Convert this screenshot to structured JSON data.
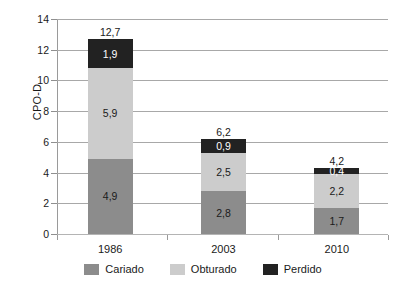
{
  "chart_data": {
    "type": "bar",
    "stacked": true,
    "title": "",
    "xlabel": "",
    "ylabel": "CPO-D",
    "categories": [
      "1986",
      "2003",
      "2010"
    ],
    "ylim": [
      0,
      14
    ],
    "yticks": [
      "0",
      "2",
      "4",
      "6",
      "8",
      "10",
      "12",
      "14"
    ],
    "ytick_values": [
      0,
      2,
      4,
      6,
      8,
      10,
      12,
      14
    ],
    "grid": "horizontal",
    "legend_position": "bottom",
    "decimal_separator": ",",
    "series": [
      {
        "name": "Cariado",
        "color": "#8c8c8c",
        "values": [
          4.9,
          2.8,
          1.7
        ],
        "labels": [
          "4,9",
          "2,8",
          "1,7"
        ],
        "label_color": "dark"
      },
      {
        "name": "Obturado",
        "color": "#cccccc",
        "values": [
          5.9,
          2.5,
          2.2
        ],
        "labels": [
          "5,9",
          "2,5",
          "2,2"
        ],
        "label_color": "dark"
      },
      {
        "name": "Perdido",
        "color": "#222222",
        "values": [
          1.9,
          0.9,
          0.4
        ],
        "labels": [
          "1,9",
          "0,9",
          "0,4"
        ],
        "label_color": "light"
      }
    ],
    "totals": [
      12.7,
      6.2,
      4.2
    ],
    "total_labels": [
      "12,7",
      "6,2",
      "4,2"
    ]
  }
}
